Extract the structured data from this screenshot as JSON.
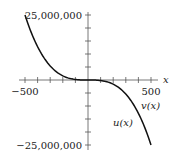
{
  "chart_data": {
    "type": "line",
    "title": "",
    "xlabel": "x",
    "ylabel": "",
    "xlim": [
      -500,
      500
    ],
    "ylim": [
      -25000000,
      25000000
    ],
    "x_ticks_step": 100,
    "y_ticks_step": 5000000,
    "tick_labels": {
      "x_min": "−500",
      "x_max": "500",
      "y_max": "25,000,000",
      "y_min": "−25,000,000"
    },
    "grid": false,
    "series": [
      {
        "name": "u(x)",
        "x": [
          -500,
          -400,
          -300,
          -200,
          -100,
          0,
          100,
          200,
          300,
          400,
          500
        ],
        "y": [
          25000000,
          12800000,
          5400000,
          1600000,
          200000,
          0,
          -200000,
          -1600000,
          -5400000,
          -12800000,
          -25000000
        ]
      },
      {
        "name": "v(x)",
        "x": [
          -500,
          -400,
          -300,
          -200,
          -100,
          0,
          100,
          200,
          300,
          400,
          500
        ],
        "y": [
          25000000,
          12800000,
          5400000,
          1600000,
          200000,
          0,
          -200000,
          -1600000,
          -5400000,
          -12800000,
          -25000000
        ]
      }
    ],
    "annotations": [
      {
        "text": "u(x)",
        "near_x": 310,
        "near_y": -11000000
      },
      {
        "text": "v(x)",
        "near_x": 470,
        "near_y": -6000000
      }
    ]
  }
}
